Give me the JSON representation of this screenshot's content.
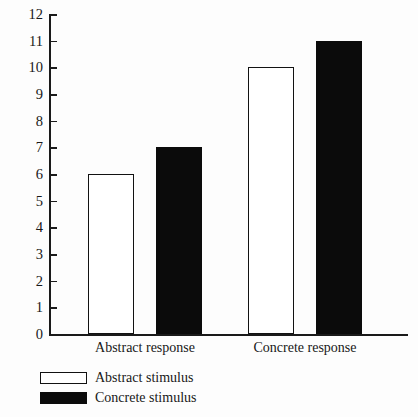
{
  "chart_data": {
    "type": "bar",
    "title": "",
    "subtitle": "",
    "xlabel": "",
    "ylabel": "Correct",
    "categories": [
      "Abstract response",
      "Concrete response"
    ],
    "series": [
      {
        "name": "Abstract stimulus",
        "style": "open",
        "color": "#ffffff",
        "border": "#121212",
        "values": [
          6,
          11
        ]
      },
      {
        "name": "Concrete stimulus",
        "style": "filled",
        "color": "#0b0b0b",
        "border": "#0b0b0b",
        "values": [
          7,
          11
        ]
      }
    ],
    "ylim": [
      0,
      12
    ],
    "ytick_step": 1,
    "yticks": [
      "0",
      "1",
      "2",
      "3",
      "4",
      "5",
      "6",
      "7",
      "8",
      "9",
      "10",
      "11",
      "12"
    ],
    "grid": false,
    "legend_position": "below-left",
    "bars": [
      {
        "group": "Abstract response",
        "series": "Abstract stimulus",
        "value": 6
      },
      {
        "group": "Abstract response",
        "series": "Concrete stimulus",
        "value": 7
      },
      {
        "group": "Concrete response",
        "series": "Abstract stimulus",
        "value": 10
      },
      {
        "group": "Concrete response",
        "series": "Concrete stimulus",
        "value": 11
      }
    ]
  },
  "legend": {
    "entries": [
      {
        "label": "Abstract stimulus",
        "style": "open"
      },
      {
        "label": "Concrete stimulus",
        "style": "filled"
      }
    ]
  }
}
